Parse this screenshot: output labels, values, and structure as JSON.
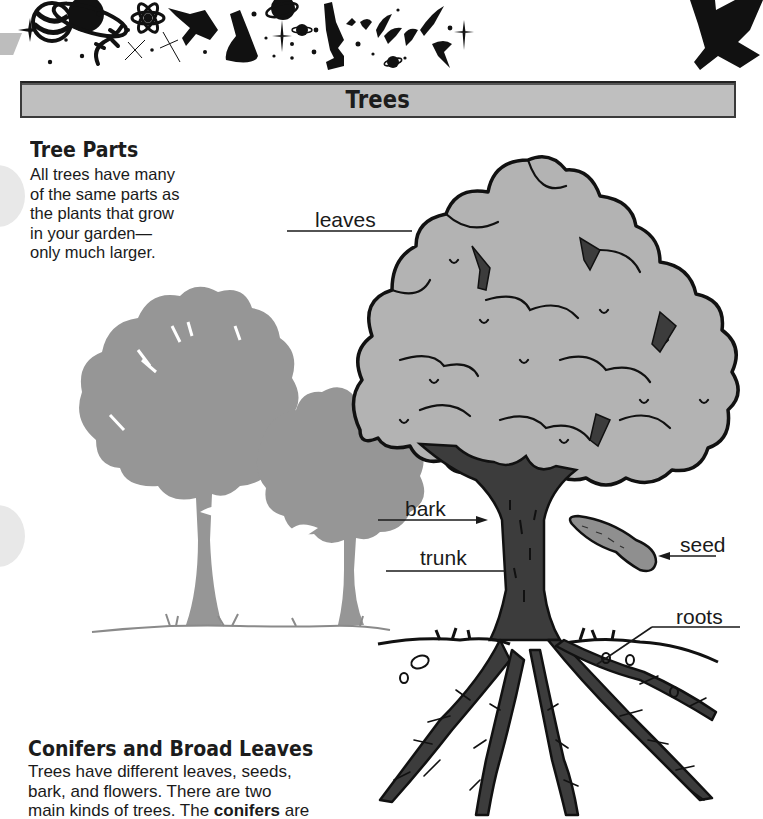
{
  "page": {
    "title": "Trees",
    "banner": {
      "icons": [
        "planet-icon",
        "ringed-planet-icon",
        "lizard-icon",
        "atom-icon",
        "sparkle-icon",
        "space-shuttle-icon",
        "flask-icon",
        "small-planet-icon",
        "microscope-icon",
        "swallow-birds-icon",
        "satellite-icon"
      ]
    },
    "sections": [
      {
        "heading": "Tree Parts",
        "lines": [
          "All trees have many",
          "of the same parts as",
          "the plants that grow",
          "in your garden—",
          "only much larger."
        ]
      },
      {
        "heading": "Conifers and Broad Leaves",
        "lines": [
          "Trees have different leaves, seeds,",
          "bark, and flowers. There are two",
          "main kinds of trees. The ",
          "conifers",
          " are",
          "trees with needle-like leaves. Their"
        ]
      }
    ],
    "diagram": {
      "labels": {
        "leaves": "leaves",
        "bark": "bark",
        "trunk": "trunk",
        "seed": "seed",
        "roots": "roots"
      }
    },
    "colors": {
      "title_bar_fill": "#bfbfbf",
      "silhouette": "#969696",
      "canopy": "#b3b3b3",
      "trunk": "#3c3c3c",
      "ink": "#1a1a1a"
    }
  }
}
